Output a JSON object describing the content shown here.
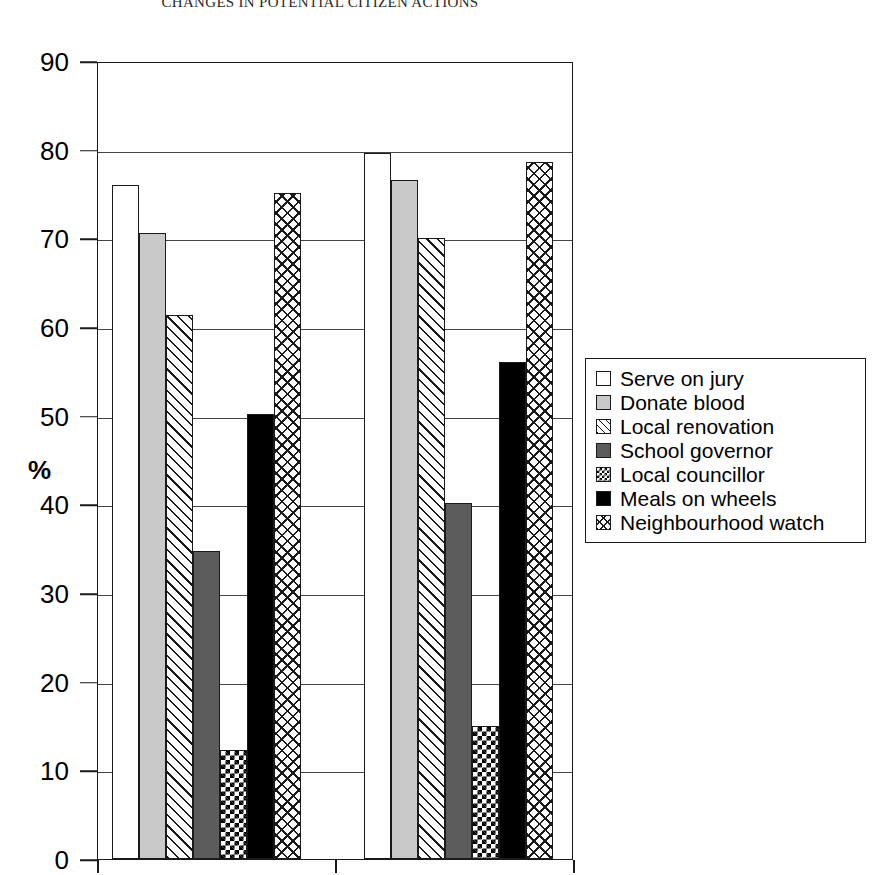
{
  "chart_data": {
    "type": "bar",
    "title": "CHANGES IN POTENTIAL CITIZEN ACTIONS",
    "xlabel": "",
    "ylabel": "%",
    "ylim": [
      0,
      90
    ],
    "yticks": [
      0,
      10,
      20,
      30,
      40,
      50,
      60,
      70,
      80,
      90
    ],
    "grid": true,
    "legend_position": "right",
    "categories": [
      "Group 1",
      "Group 2"
    ],
    "series": [
      {
        "name": "Serve on jury",
        "pattern": "white",
        "values": [
          76.0,
          79.6
        ]
      },
      {
        "name": "Donate blood",
        "pattern": "lightgray",
        "values": [
          70.6,
          76.6
        ]
      },
      {
        "name": "Local renovation",
        "pattern": "diagonal",
        "values": [
          61.3,
          70.0
        ]
      },
      {
        "name": "School governor",
        "pattern": "darkgray",
        "values": [
          34.7,
          40.1
        ]
      },
      {
        "name": "Local councillor",
        "pattern": "checker",
        "values": [
          12.3,
          15.0
        ]
      },
      {
        "name": "Meals on wheels",
        "pattern": "black",
        "values": [
          50.2,
          56.0
        ]
      },
      {
        "name": "Neighbourhood watch",
        "pattern": "crosshatch",
        "values": [
          75.1,
          78.6
        ]
      }
    ]
  },
  "legend": {
    "items": [
      {
        "label": "Serve on jury"
      },
      {
        "label": "Donate blood"
      },
      {
        "label": "Local renovation"
      },
      {
        "label": "School governor"
      },
      {
        "label": "Local councillor"
      },
      {
        "label": "Meals on wheels"
      },
      {
        "label": "Neighbourhood watch"
      }
    ]
  }
}
